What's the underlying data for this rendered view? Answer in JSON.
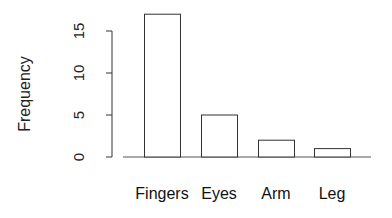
{
  "chart_data": {
    "type": "bar",
    "title": "",
    "xlabel": "",
    "ylabel": "Frequency",
    "categories": [
      "Fingers",
      "Eyes",
      "Arm",
      "Leg"
    ],
    "values": [
      17,
      5,
      2,
      1
    ],
    "yticks": [
      0,
      5,
      10,
      15
    ],
    "ylim": [
      0,
      17
    ],
    "grid": false,
    "legend": null,
    "bar_fill": "#ffffff",
    "bar_stroke": "#333333"
  }
}
